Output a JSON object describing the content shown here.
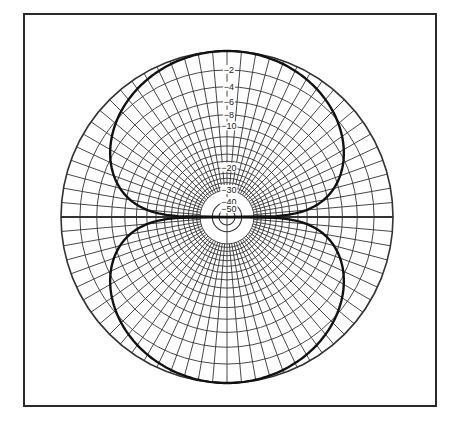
{
  "chart_data": {
    "type": "polar",
    "title": "",
    "subtitle": "",
    "xlabel": "",
    "ylabel": "",
    "radial_scale": "dB (logarithmic radius)",
    "radial_range_db": [
      -50,
      0
    ],
    "ring_labels": [
      "-2",
      "-4",
      "-6",
      "-8",
      "-10",
      "-20",
      "-30",
      "-40",
      "-50"
    ],
    "ring_label_values_db": [
      -2,
      -4,
      -6,
      -8,
      -10,
      -20,
      -30,
      -40,
      -50
    ],
    "grid_rings_db": [
      0,
      -2,
      -4,
      -6,
      -8,
      -10,
      -12,
      -14,
      -16,
      -18,
      -20,
      -22,
      -24,
      -26,
      -28,
      -30
    ],
    "extra_circles_db": [
      -40,
      -50
    ],
    "spoke_step_deg": 5,
    "grid": true,
    "legend": null,
    "series": [
      {
        "name": "figure-eight pattern",
        "shape": "bidirectional lobes pointing up (0°) and down (180°), nulls at 90° and 270°",
        "points_deg_db": [
          [
            0,
            0
          ],
          [
            10,
            -0.1
          ],
          [
            20,
            -0.5
          ],
          [
            30,
            -1.1
          ],
          [
            40,
            -2.1
          ],
          [
            50,
            -3.5
          ],
          [
            55,
            -4.4
          ],
          [
            60,
            -5.6
          ],
          [
            65,
            -7.2
          ],
          [
            70,
            -9.3
          ],
          [
            75,
            -12.1
          ],
          [
            80,
            -16.6
          ],
          [
            85,
            -25
          ],
          [
            90,
            -50
          ],
          [
            180,
            0
          ],
          [
            190,
            -0.1
          ],
          [
            200,
            -0.5
          ],
          [
            210,
            -1.1
          ],
          [
            220,
            -2.1
          ],
          [
            230,
            -3.5
          ],
          [
            240,
            -5.6
          ],
          [
            250,
            -9.3
          ],
          [
            260,
            -16.6
          ],
          [
            270,
            -50
          ]
        ]
      }
    ]
  },
  "figure": {
    "frame_color": "#2a2a2a",
    "grid_color": "#333333",
    "trace_color": "#111111"
  }
}
